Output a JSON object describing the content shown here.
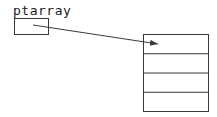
{
  "diagram": {
    "pointer_label": "ptarray",
    "array_rows": 4,
    "line_color": "#3a3a3a",
    "background_color": "#ffffff"
  }
}
